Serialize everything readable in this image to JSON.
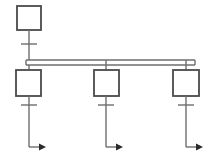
{
  "canvas": {
    "width": 212,
    "height": 160,
    "background": "#ffffff",
    "title": "single-line-distribution-diagram"
  },
  "style": {
    "line_color": "#6e6e6e",
    "box_stroke": "#4a4a4a",
    "box_fill": "#ffffff",
    "arrow_fill": "#2b2b2b",
    "stroke_width": 1.4,
    "box_stroke_width": 1.8
  },
  "chart_data": {
    "type": "diagram",
    "title": "",
    "nodes": [
      {
        "id": "source",
        "name": "source-box",
        "shape": "rectangle",
        "x": 17,
        "y": 6,
        "width": 24,
        "height": 24,
        "label": ""
      },
      {
        "id": "feeder-1",
        "name": "feeder-box-1",
        "shape": "rectangle",
        "x": 16,
        "y": 70,
        "width": 25,
        "height": 26,
        "label": ""
      },
      {
        "id": "feeder-2",
        "name": "feeder-box-2",
        "shape": "rectangle",
        "x": 94,
        "y": 70,
        "width": 25,
        "height": 26,
        "label": ""
      },
      {
        "id": "feeder-3",
        "name": "feeder-box-3",
        "shape": "rectangle",
        "x": 173,
        "y": 70,
        "width": 26,
        "height": 26,
        "label": ""
      }
    ],
    "busbar": {
      "id": "busbar",
      "name": "busbar",
      "x1": 26,
      "x2": 195,
      "y_top": 60,
      "y_bottom": 65,
      "rails": 2
    },
    "connectors": [
      {
        "id": "src-drop",
        "name": "source-drop-line",
        "x": 29,
        "y1": 30,
        "y2": 60,
        "tick_y": 44
      },
      {
        "id": "bus-to-f1",
        "name": "busbar-to-feeder-1-line",
        "x": 29,
        "y1": 65,
        "y2": 70
      },
      {
        "id": "bus-to-f2",
        "name": "busbar-to-feeder-2-line",
        "x": 106,
        "y1": 60,
        "y2": 70
      },
      {
        "id": "bus-to-f3",
        "name": "busbar-to-feeder-3-line",
        "x": 186,
        "y1": 60,
        "y2": 70
      },
      {
        "id": "f1-out",
        "name": "feeder-1-output-line",
        "x": 29,
        "y1": 96,
        "y2": 147,
        "tick_y": 105,
        "arrow_x": 42,
        "arrow_y": 147
      },
      {
        "id": "f2-out",
        "name": "feeder-2-output-line",
        "x": 106,
        "y1": 96,
        "y2": 147,
        "tick_y": 105,
        "arrow_x": 119,
        "arrow_y": 147
      },
      {
        "id": "f3-out",
        "name": "feeder-3-output-line",
        "x": 186,
        "y1": 96,
        "y2": 147,
        "tick_y": 105,
        "arrow_x": 199,
        "arrow_y": 147
      }
    ],
    "ticks": [
      {
        "name": "source-tick",
        "cx": 29,
        "cy": 44,
        "half_width": 8
      },
      {
        "name": "feeder-1-tick",
        "cx": 29,
        "cy": 105,
        "half_width": 8
      },
      {
        "name": "feeder-2-tick",
        "cx": 106,
        "cy": 105,
        "half_width": 8
      },
      {
        "name": "feeder-3-tick",
        "cx": 186,
        "cy": 105,
        "half_width": 8
      }
    ],
    "arrows": [
      {
        "name": "output-arrow-1",
        "tip_x": 46,
        "tip_y": 147,
        "direction": "right"
      },
      {
        "name": "output-arrow-2",
        "tip_x": 123,
        "tip_y": 147,
        "direction": "right"
      },
      {
        "name": "output-arrow-3",
        "tip_x": 203,
        "tip_y": 147,
        "direction": "right"
      }
    ],
    "annotations": [],
    "legend": []
  }
}
